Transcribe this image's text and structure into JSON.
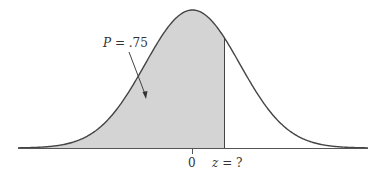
{
  "chart_data": {
    "type": "area",
    "title": "",
    "distribution": "standard normal",
    "shaded_region": {
      "from": "-inf",
      "to": "z",
      "probability": 0.75
    },
    "annotation": {
      "variable": "P",
      "text": " = .75"
    },
    "x_ticks": [
      {
        "value": 0,
        "label": "0"
      }
    ],
    "z_label": {
      "variable": "z",
      "text": " = ?"
    },
    "z_value_implied": 0.674,
    "xlabel": "",
    "ylabel": "",
    "grid": false,
    "legend": false,
    "colors": {
      "shade": "#d4d4d4",
      "curve": "#444444",
      "axis": "#555555"
    }
  }
}
